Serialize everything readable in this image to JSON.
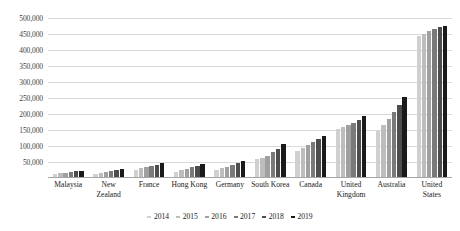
{
  "chart_data": {
    "type": "bar",
    "title": "",
    "subtitle": "",
    "xlabel": "",
    "ylabel": "",
    "ylim": [
      0,
      500000
    ],
    "ytick_step": 50000,
    "ytick_labels": [
      "500,000",
      "450,000",
      "400,000",
      "350,000",
      "300,000",
      "250,000",
      "200,000",
      "150,000",
      "100,000",
      "50,000"
    ],
    "grid": true,
    "legend_position": "bottom",
    "categories": [
      "Malaysia",
      "New Zealand",
      "France",
      "Hong Kong",
      "Germany",
      "South Korea",
      "Canada",
      "United Kingdom",
      "Australia",
      "United States"
    ],
    "series": [
      {
        "name": "2014",
        "color": "#d0d0d0",
        "values": [
          13000,
          12000,
          26000,
          20000,
          25000,
          58000,
          84000,
          154000,
          148000,
          444000
        ]
      },
      {
        "name": "2015",
        "color": "#bdbdbd",
        "values": [
          15000,
          15000,
          30000,
          24000,
          30000,
          63000,
          93000,
          160000,
          165000,
          450000
        ]
      },
      {
        "name": "2016",
        "color": "#a0a0a0",
        "values": [
          17000,
          18000,
          34000,
          28000,
          35000,
          70000,
          102000,
          166000,
          185000,
          458000
        ]
      },
      {
        "name": "2017",
        "color": "#7a7a7a",
        "values": [
          19000,
          21000,
          38000,
          33000,
          40000,
          80000,
          112000,
          173000,
          205000,
          465000
        ]
      },
      {
        "name": "2018",
        "color": "#4d4d4d",
        "values": [
          21000,
          24000,
          42000,
          38000,
          46000,
          92000,
          122000,
          182000,
          228000,
          471000
        ]
      },
      {
        "name": "2019",
        "color": "#1a1a1a",
        "values": [
          23000,
          27000,
          46000,
          44000,
          52000,
          105000,
          131000,
          194000,
          254000,
          476000
        ]
      }
    ]
  }
}
